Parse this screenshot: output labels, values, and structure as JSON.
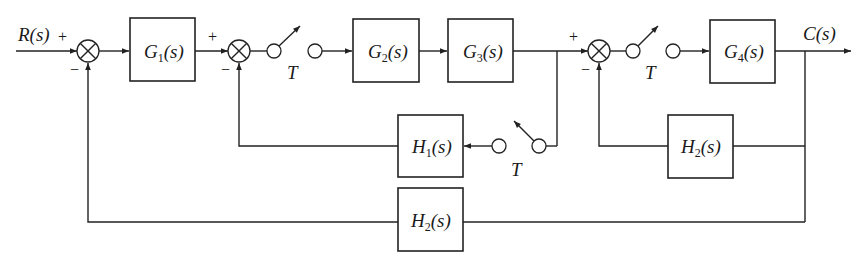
{
  "diagram": {
    "type": "sampled-data control system block diagram",
    "input_label": "R(s)",
    "output_label": "C(s)",
    "sampler_label": "T",
    "blocks": [
      {
        "id": "G1",
        "name": "G",
        "sub": "1",
        "arg": "(s)",
        "label": "G1(s)"
      },
      {
        "id": "G2",
        "name": "G",
        "sub": "2",
        "arg": "(s)",
        "label": "G2(s)"
      },
      {
        "id": "G3",
        "name": "G",
        "sub": "3",
        "arg": "(s)",
        "label": "G3(s)"
      },
      {
        "id": "G4",
        "name": "G",
        "sub": "4",
        "arg": "(s)",
        "label": "G4(s)"
      },
      {
        "id": "H1",
        "name": "H",
        "sub": "1",
        "arg": "(s)",
        "label": "H1(s)"
      },
      {
        "id": "H2a",
        "name": "H",
        "sub": "2",
        "arg": "(s)",
        "label": "H2(s)"
      },
      {
        "id": "H2b",
        "name": "H",
        "sub": "2",
        "arg": "(s)",
        "label": "H2(s)"
      }
    ],
    "summing_junctions": [
      {
        "id": "S1",
        "plus": "+",
        "minus": "−"
      },
      {
        "id": "S2",
        "plus": "+",
        "minus": "−"
      },
      {
        "id": "S3",
        "plus": "+",
        "minus": "−"
      }
    ],
    "samplers": [
      {
        "id": "T1",
        "label": "T",
        "location": "after S2, before G2"
      },
      {
        "id": "T2",
        "label": "T",
        "location": "after S3, before G4"
      },
      {
        "id": "T3",
        "label": "T",
        "location": "feedback from G3 output into H1"
      }
    ],
    "edges": [
      {
        "from": "R(s)",
        "to": "S1",
        "sign": "+"
      },
      {
        "from": "S1",
        "to": "G1"
      },
      {
        "from": "G1",
        "to": "S2",
        "sign": "+"
      },
      {
        "from": "S2",
        "to": "T1"
      },
      {
        "from": "T1",
        "to": "G2"
      },
      {
        "from": "G2",
        "to": "G3"
      },
      {
        "from": "G3",
        "to": "S3",
        "sign": "+"
      },
      {
        "from": "G3",
        "to": "T3"
      },
      {
        "from": "T3",
        "to": "H1"
      },
      {
        "from": "H1",
        "to": "S2",
        "sign": "−"
      },
      {
        "from": "S3",
        "to": "T2"
      },
      {
        "from": "T2",
        "to": "G4"
      },
      {
        "from": "G4",
        "to": "C(s)"
      },
      {
        "from": "C(s)",
        "to": "H2a"
      },
      {
        "from": "H2a",
        "to": "S3",
        "sign": "−"
      },
      {
        "from": "C(s)",
        "to": "H2b"
      },
      {
        "from": "H2b",
        "to": "S1",
        "sign": "−"
      }
    ]
  }
}
